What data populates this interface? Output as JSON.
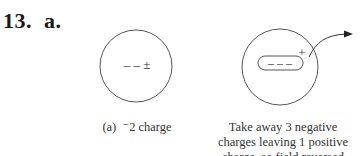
{
  "problem": {
    "number_label": "13.  a."
  },
  "figure_a": {
    "inner_charges": "– – ±",
    "caption_prefix": "(a)",
    "caption_text": "⁻2 charge"
  },
  "figure_b": {
    "capsule_charges": "– – –",
    "plus_charge": "+",
    "caption_lines": [
      "Take away 3 negative",
      "charges leaving 1 positive",
      "charge, so field reversed"
    ]
  }
}
